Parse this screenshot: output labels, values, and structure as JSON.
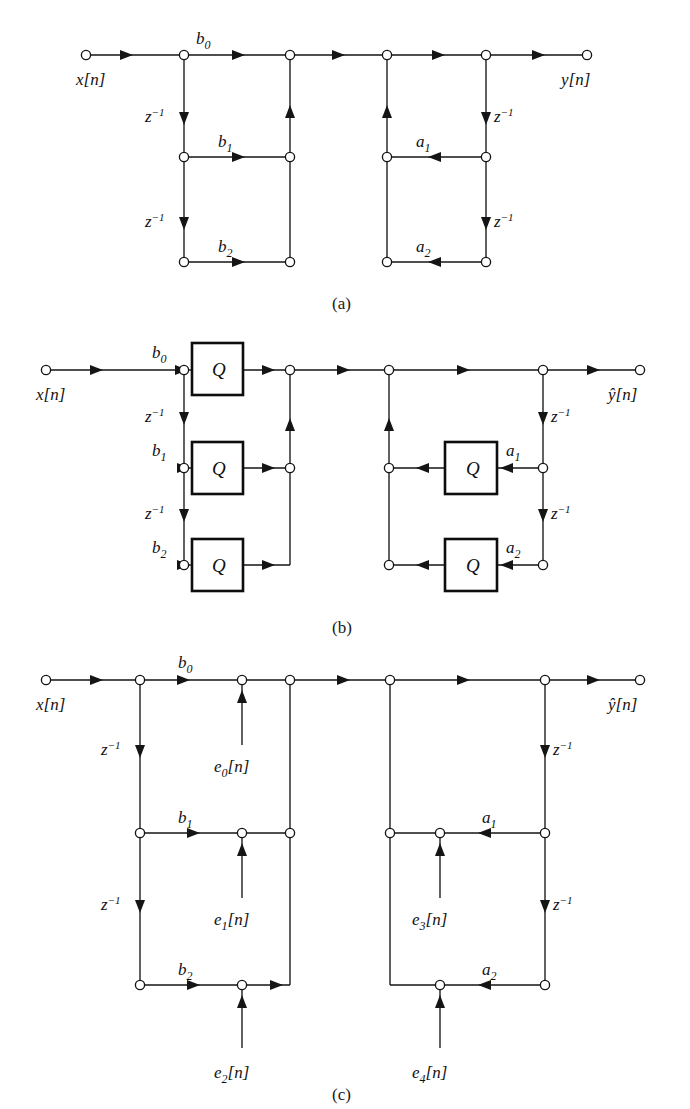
{
  "figure": {
    "type": "signal-flow-graph"
  },
  "captions": {
    "a": "(a)",
    "b": "(b)",
    "c": "(c)"
  },
  "labels": {
    "x_input": "x[n]",
    "y_output": "y[n]",
    "yhat_output": "ŷ[n]",
    "b0": "b",
    "b1": "b",
    "b2": "b",
    "a1": "a",
    "a2": "a",
    "sub0": "0",
    "sub1": "1",
    "sub2": "2",
    "delay": "z",
    "delay_exp": "−1",
    "quantizer": "Q",
    "e0": "e",
    "e1": "e",
    "e2": "e",
    "e3": "e",
    "e4": "e",
    "bracket_n": "[n]"
  },
  "panels": [
    {
      "id": "a",
      "caption": "(a)",
      "input": "x[n]",
      "output": "y[n]",
      "feedforward_coeffs": [
        "b0",
        "b1",
        "b2"
      ],
      "feedback_coeffs": [
        "a1",
        "a2"
      ],
      "delays": [
        "z^-1",
        "z^-1",
        "z^-1",
        "z^-1"
      ],
      "quantizers": 0,
      "noise_sources": []
    },
    {
      "id": "b",
      "caption": "(b)",
      "input": "x[n]",
      "output": "ŷ[n]",
      "feedforward_coeffs": [
        "b0",
        "b1",
        "b2"
      ],
      "feedback_coeffs": [
        "a1",
        "a2"
      ],
      "delays": [
        "z^-1",
        "z^-1",
        "z^-1",
        "z^-1"
      ],
      "quantizers": 5,
      "quantizer_label": "Q",
      "noise_sources": []
    },
    {
      "id": "c",
      "caption": "(c)",
      "input": "x[n]",
      "output": "ŷ[n]",
      "feedforward_coeffs": [
        "b0",
        "b1",
        "b2"
      ],
      "feedback_coeffs": [
        "a1",
        "a2"
      ],
      "delays": [
        "z^-1",
        "z^-1",
        "z^-1",
        "z^-1"
      ],
      "quantizers": 0,
      "noise_sources": [
        "e0[n]",
        "e1[n]",
        "e2[n]",
        "e3[n]",
        "e4[n]"
      ]
    }
  ],
  "colors": {
    "line": "#151515",
    "text": "#111111",
    "background": "#ffffff",
    "node_fill": "#ffffff"
  }
}
